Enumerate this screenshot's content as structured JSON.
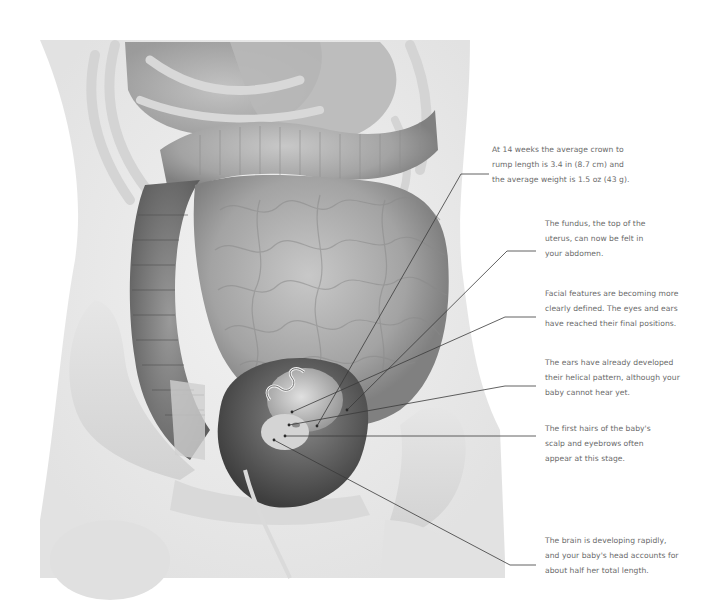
{
  "figure": {
    "palette": {
      "background": "#ffffff",
      "body_silhouette": "#ececec",
      "bone": "#dcdcdc",
      "intestine_dark": "#7d7d7d",
      "intestine_mid": "#a3a3a3",
      "intestine_light": "#c4c4c4",
      "uterus": "#5c5c5c",
      "fetus": "#b5b5b5",
      "leader_line": "#3a3a3a",
      "label_text": "#6a6a6a"
    }
  },
  "annotations": [
    {
      "id": "crown-rump",
      "text": "At 14 weeks the average crown to\nrump length is 3.4 in (8.7 cm) and\nthe average weight is 1.5 oz (43 g).",
      "label_x": 492,
      "label_y": 142,
      "leader": [
        [
          489,
          174
        ],
        [
          461,
          174
        ],
        [
          317,
          426
        ]
      ]
    },
    {
      "id": "fundus",
      "text": "The fundus, the top of the\nuterus, can now be felt in\nyour abdomen.",
      "label_x": 545,
      "label_y": 216,
      "leader": [
        [
          536,
          251
        ],
        [
          507,
          251
        ],
        [
          347,
          410
        ]
      ]
    },
    {
      "id": "facial-features",
      "text": "Facial features are becoming more\nclearly defined. The eyes and ears\nhave reached their final positions.",
      "label_x": 545,
      "label_y": 286,
      "leader": [
        [
          536,
          317
        ],
        [
          505,
          317
        ],
        [
          292,
          412
        ]
      ]
    },
    {
      "id": "ears",
      "text": "The ears have already developed\ntheir helical pattern, although your\nbaby cannot hear yet.",
      "label_x": 545,
      "label_y": 355,
      "leader": [
        [
          536,
          386
        ],
        [
          505,
          386
        ],
        [
          289,
          425
        ]
      ]
    },
    {
      "id": "hairs",
      "text": "The first hairs of the baby's\nscalp and eyebrows often\nappear at this stage.",
      "label_x": 545,
      "label_y": 421,
      "leader": [
        [
          536,
          436
        ],
        [
          285,
          436
        ]
      ]
    },
    {
      "id": "brain",
      "text": "The brain is developing rapidly,\nand your baby's head accounts for\nabout half her total length.",
      "label_x": 545,
      "label_y": 533,
      "leader": [
        [
          536,
          565
        ],
        [
          510,
          565
        ],
        [
          274,
          440
        ]
      ]
    }
  ]
}
